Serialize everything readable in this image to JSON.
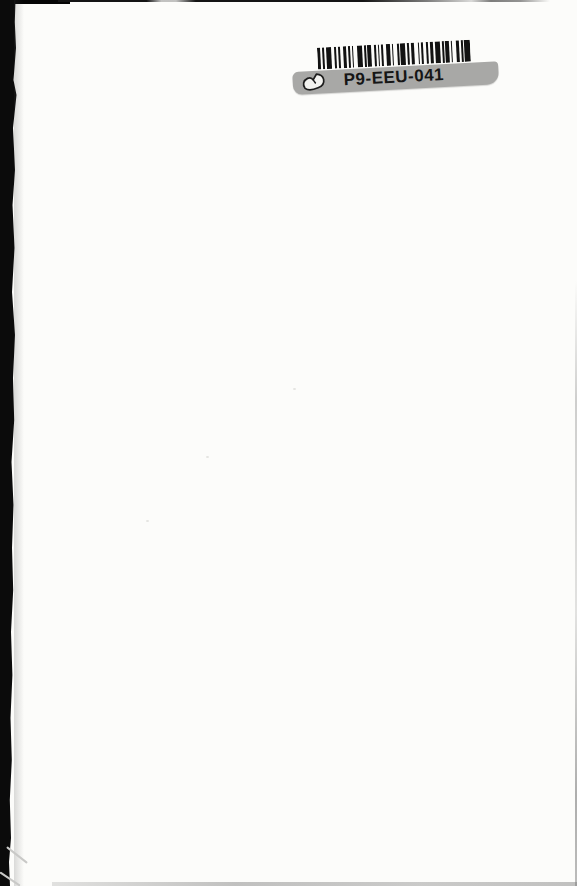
{
  "page": {
    "background_color": "#fcfcfa",
    "edge_color": "#0b0b0b"
  },
  "sticker": {
    "label_text": "P9-EEU-041",
    "label_bg_color": "#a8a8a6",
    "bar_color": "#121212",
    "barcode_pattern": [
      2,
      1,
      1,
      1,
      3,
      2,
      1,
      1,
      1,
      2,
      2,
      1,
      1,
      1,
      1,
      2,
      3,
      1,
      1,
      1,
      2,
      2,
      1,
      1,
      1,
      1,
      1,
      2,
      2,
      1,
      1,
      2,
      1,
      1,
      3,
      1,
      1,
      1,
      2,
      2,
      1,
      1,
      1,
      2,
      1,
      1,
      2,
      1,
      3,
      1,
      1,
      1,
      2,
      1,
      1,
      2,
      2,
      1,
      1,
      1,
      3
    ]
  }
}
